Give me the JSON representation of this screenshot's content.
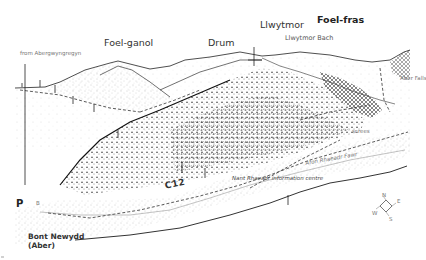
{
  "map": {
    "type": "panoramic-illustrated-walk-map",
    "peaks": [
      {
        "name": "Foel-ganol",
        "emphasis": "normal"
      },
      {
        "name": "Drum",
        "emphasis": "normal"
      },
      {
        "name": "Llwytmor",
        "emphasis": "normal"
      },
      {
        "name": "Llwytmor Bach",
        "emphasis": "small"
      },
      {
        "name": "Foel-fras",
        "emphasis": "bold"
      }
    ],
    "labels": {
      "from_town": "from Abergwyngregyn",
      "falls": "Aber Falls",
      "scree": "screes",
      "river": "Afon Rhaeadr Fawr",
      "info_centre": "Nant Rhaeadr information centre",
      "route_code": "C12",
      "parking": "P",
      "road_number": "B",
      "bridge_line1": "Bont Newydd",
      "bridge_line2": "(Aber)"
    },
    "compass": {
      "directions": [
        "N",
        "E",
        "S",
        "W"
      ]
    },
    "colors": {
      "ink": "#222222",
      "stipple": "#8a8a8a",
      "forest": "#4a4a4a",
      "paper": "#ffffff"
    }
  }
}
